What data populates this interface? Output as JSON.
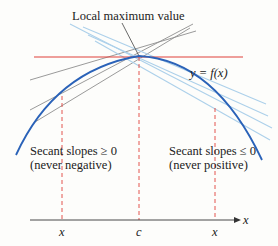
{
  "title": "Local maximum value",
  "curve_label": "y = f(x)",
  "left_note": {
    "line1": "Secant slopes ≥ 0",
    "line2": "(never negative)"
  },
  "right_note": {
    "line1": "Secant slopes ≤ 0",
    "line2": "(never positive)"
  },
  "axis": {
    "x_label": "x",
    "ticks": [
      "x",
      "c",
      "x"
    ]
  },
  "colors": {
    "curve": "#2a62b8",
    "tangent": "#e0413a",
    "dashed": "#e0413a",
    "secant_left": "#8a8a8a",
    "secant_right": "#a9cfe8"
  }
}
